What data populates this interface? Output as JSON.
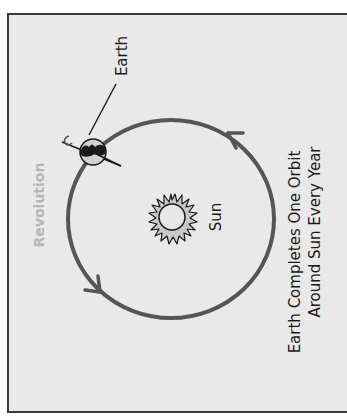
{
  "diagram": {
    "labels": {
      "earth": "Earth",
      "sun": "Sun",
      "revolution": "Revolution",
      "caption_line1": "Earth Completes One Orbit",
      "caption_line2": "Around Sun Every Year"
    },
    "icons": {
      "earth": "globe-icon",
      "sun": "sun-icon",
      "rotation": "rotation-arrow-icon"
    },
    "colors": {
      "background": "#e9e9e9",
      "frame": "#3a3a3a",
      "orbit": "#555555",
      "text": "#1a1a1a",
      "revolution_text": "#b5b5b5",
      "sun_fill": "#c8c8c8",
      "sun_core": "#e6e6e6"
    }
  }
}
